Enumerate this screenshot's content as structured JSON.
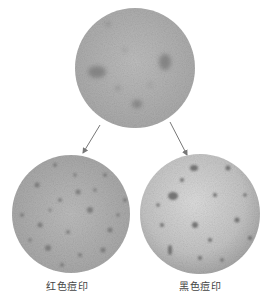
{
  "diagram": {
    "nodes": [
      {
        "id": "skin-before",
        "label": "",
        "description": "magnified skin texture with acne marks"
      },
      {
        "id": "red-marks",
        "label": "红色痘印",
        "description": "magnified skin with scattered reddish marks"
      },
      {
        "id": "black-marks",
        "label": "黑色痘印",
        "description": "magnified skin with scattered dark marks"
      }
    ],
    "edges": [
      {
        "from": "skin-before",
        "to": "red-marks"
      },
      {
        "from": "skin-before",
        "to": "black-marks"
      }
    ],
    "labels": {
      "left": "红色痘印",
      "right": "黑色痘印"
    },
    "colors": {
      "skin_base": "#b5b5b5",
      "spot_dark": "#6e6e6e",
      "arrow": "#777777",
      "label_text": "#444444"
    }
  }
}
